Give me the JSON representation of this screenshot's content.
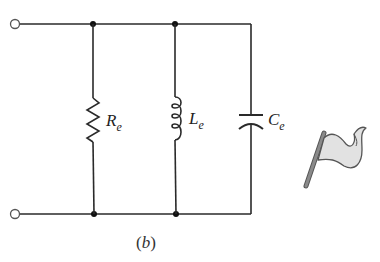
{
  "figure": {
    "caption": "(b)",
    "caption_parts": {
      "open": "(",
      "letter": "b",
      "close": ")"
    }
  },
  "circuit": {
    "topology": "parallel RLC",
    "terminals": [
      "input-top",
      "input-bottom"
    ],
    "components": [
      {
        "type": "resistor",
        "symbol": "R",
        "subscript": "e"
      },
      {
        "type": "inductor",
        "symbol": "L",
        "subscript": "e"
      },
      {
        "type": "capacitor",
        "symbol": "C",
        "subscript": "e"
      }
    ]
  },
  "icons": {
    "flag": "flag-icon"
  },
  "colors": {
    "wire": "#2a2a2a",
    "flag_fill": "#e2e2e2",
    "flag_outline": "#555555",
    "pole": "#777777"
  }
}
